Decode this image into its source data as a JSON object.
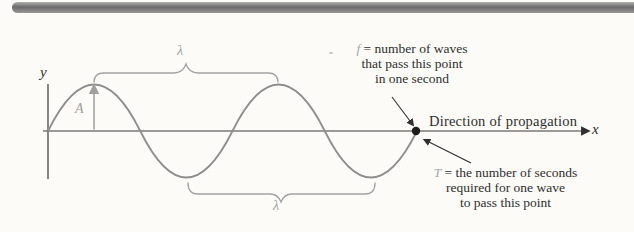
{
  "axes": {
    "x_label": "x",
    "y_label": "y"
  },
  "wave": {
    "amplitude_label": "A",
    "wavelength_label_top": "λ",
    "wavelength_label_bottom": "λ"
  },
  "annotations": {
    "direction": "Direction of propagation",
    "frequency": {
      "var": "f",
      "line1": "= number of waves",
      "line2": "that pass this point",
      "line3": "in one second"
    },
    "period": {
      "var": "T",
      "line1": "= the number of seconds",
      "line2": "required for one wave",
      "line3": "to pass this point"
    }
  },
  "colors": {
    "curve": "#8e8e8e",
    "annotation_gray": "#a2a2a2",
    "ink": "#2f2f2f",
    "top_bar": "#7b7b7b",
    "background": "#fcfbf8"
  }
}
